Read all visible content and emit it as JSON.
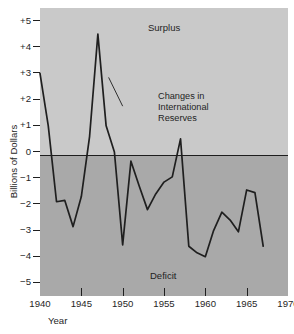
{
  "chart_data": {
    "type": "line",
    "title": "",
    "xlabel": "Year",
    "ylabel": "Billions of Dollars",
    "xlim": [
      1940,
      1970
    ],
    "ylim": [
      -5.5,
      5.5
    ],
    "grid": false,
    "legend_position": "none",
    "x_ticks": [
      "1940",
      "1945",
      "1950",
      "1955",
      "1960",
      "1965",
      "1970"
    ],
    "x_tick_values": [
      1940,
      1945,
      1950,
      1955,
      1960,
      1965,
      1970
    ],
    "y_ticks": [
      "+5",
      "+4",
      "+3",
      "+2",
      "+1",
      "0",
      "−1",
      "−2",
      "−3",
      "−4",
      "−5"
    ],
    "y_tick_values": [
      5,
      4,
      3,
      2,
      1,
      0,
      -1,
      -2,
      -3,
      -4,
      -5
    ],
    "series": [
      {
        "name": "Changes in International Reserves",
        "x": [
          1940,
          1941,
          1942,
          1943,
          1944,
          1945,
          1946,
          1947,
          1948,
          1949,
          1950,
          1951,
          1952,
          1953,
          1954,
          1955,
          1956,
          1957,
          1958,
          1959,
          1960,
          1961,
          1962,
          1963,
          1964,
          1965,
          1966,
          1967
        ],
        "values": [
          3.0,
          1.0,
          -1.9,
          -1.85,
          -2.85,
          -1.7,
          0.6,
          4.5,
          1.0,
          0.0,
          -3.55,
          -0.35,
          -1.3,
          -2.2,
          -1.6,
          -1.15,
          -0.95,
          0.5,
          -3.6,
          -3.85,
          -4.0,
          -3.0,
          -2.3,
          -2.6,
          -3.05,
          -1.45,
          -1.55,
          -3.6
        ]
      }
    ],
    "annotations": [
      {
        "name": "surplus-zone-label",
        "text": "Surplus",
        "x": 1953,
        "y": 5.1
      },
      {
        "name": "deficit-zone-label",
        "text": "Deficit",
        "x": 1953,
        "y": -4.6
      },
      {
        "name": "series-callout",
        "text_lines": [
          "Changes in",
          "International",
          "Reserves"
        ],
        "x": 1950,
        "y": 2.0
      }
    ],
    "bands": [
      {
        "name": "surplus-band",
        "range": [
          0,
          5.5
        ],
        "color": "#c9c9c9"
      },
      {
        "name": "deficit-band",
        "range": [
          -5.5,
          0
        ],
        "color": "#a9a9a9"
      }
    ],
    "colors": {
      "line": "#1f1f1f",
      "surplus_band": "#c9c9c9",
      "deficit_band": "#a9a9a9",
      "axis": "#1f1f1f",
      "background": "#ffffff"
    }
  },
  "callout": {
    "line1": "Changes in",
    "line2": "International",
    "line3": "Reserves"
  }
}
